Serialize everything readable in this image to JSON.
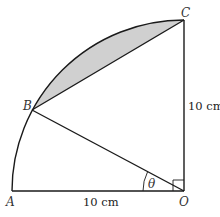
{
  "diagram": {
    "type": "circle-sector",
    "points": {
      "A": "A",
      "B": "B",
      "C": "C",
      "O": "O"
    },
    "angle_label": "θ",
    "dimensions": {
      "OA": "10 cm",
      "OC": "10 cm"
    },
    "right_angle_at": "O",
    "colors": {
      "line": "#1a1a1a",
      "shade": "#d0d0d0"
    }
  }
}
